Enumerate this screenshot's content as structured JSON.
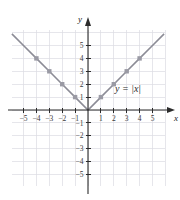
{
  "chart_data": {
    "type": "line",
    "title": "",
    "equation_label": "y = |x|",
    "xlabel": "x",
    "ylabel": "y",
    "xlim": [
      -5.9,
      6.0
    ],
    "ylim": [
      -5.9,
      6.2
    ],
    "xticks": [
      -5,
      -4,
      -3,
      -2,
      -1,
      1,
      2,
      3,
      4,
      5
    ],
    "yticks": [
      -5,
      -4,
      -3,
      -2,
      -1,
      1,
      2,
      3,
      4,
      5
    ],
    "xticklabels": [
      "−5",
      "−4",
      "−3",
      "−2",
      "−1",
      "1",
      "2",
      "3",
      "4",
      "5"
    ],
    "yticklabels": [
      "−5",
      "−4",
      "−3",
      "−2",
      "−1",
      "1",
      "2",
      "3",
      "4",
      "5"
    ],
    "grid": true,
    "legend": "none",
    "series": [
      {
        "name": "y = |x|",
        "x": [
          -5.9,
          -5,
          -4,
          -3,
          -2,
          -1,
          0,
          1,
          2,
          3,
          4,
          5,
          5.9
        ],
        "values": [
          5.9,
          5,
          4,
          3,
          2,
          1,
          0,
          1,
          2,
          3,
          4,
          5,
          5.9
        ],
        "markers_x": [
          -4,
          -3,
          -2,
          -1,
          1,
          2,
          3,
          4
        ],
        "markers_y": [
          4,
          3,
          2,
          1,
          1,
          2,
          3,
          4
        ],
        "color": "#8c8c96",
        "marker": "square"
      }
    ],
    "colors": {
      "grid": "#dcdce2",
      "axis": "#2b2b2b",
      "curve": "#8c8c96",
      "marker": "#9a9aa4",
      "text": "#2a2a2a",
      "background": "#ffffff"
    }
  }
}
